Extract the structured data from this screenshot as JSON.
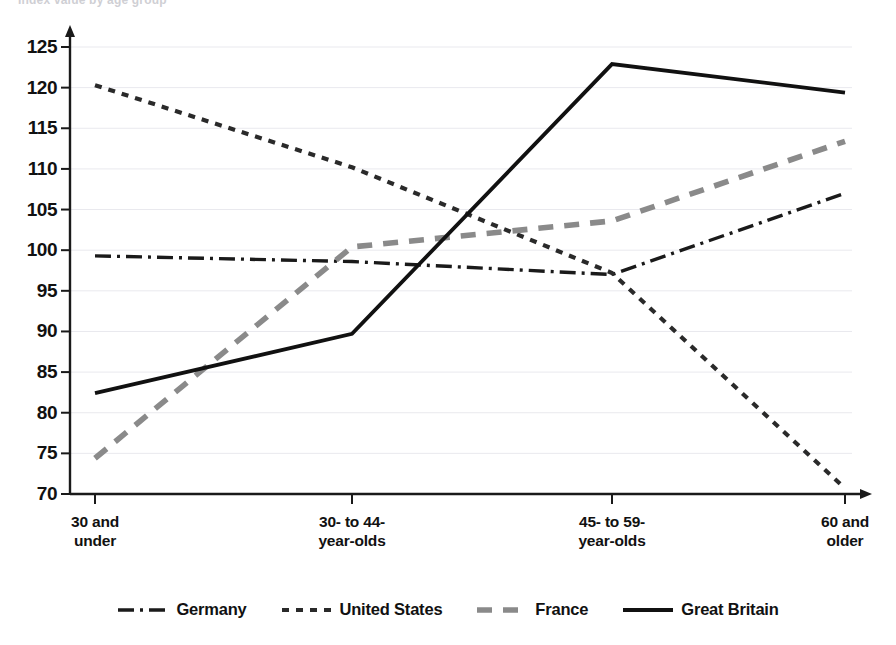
{
  "figure": {
    "clipped_header_text": "Index value by age group",
    "axis_color": "#1a1a1a",
    "grid_color": "#e9e9ee",
    "background": "#ffffff"
  },
  "chart_data": {
    "type": "line",
    "title": "",
    "subtitle": "",
    "xlabel": "",
    "ylabel": "",
    "grid": true,
    "legend_position": "bottom",
    "categories": [
      "30 and\nunder",
      "30- to 44-\nyear-olds",
      "45- to 59-\nyear-olds",
      "60 and\nolder"
    ],
    "category_labels_flat": [
      "30 and under",
      "30- to 44-year-olds",
      "45- to 59-year-olds",
      "60 and older"
    ],
    "ylim": [
      70,
      125
    ],
    "yticks": [
      125,
      120,
      115,
      110,
      105,
      100,
      95,
      90,
      85,
      80,
      75,
      70
    ],
    "ytick_labels": [
      "125",
      "120",
      "115",
      "110",
      "105",
      "100",
      "95",
      "90",
      "85",
      "80",
      "75",
      "70"
    ],
    "series": [
      {
        "name": "Germany",
        "values": [
          99.3,
          98.6,
          97.0,
          107.0
        ],
        "style": "dash-dot",
        "color": "#1a1a1a",
        "width": 3.4,
        "dasharray": "16,6,3,6"
      },
      {
        "name": "United States",
        "values": [
          120.3,
          110.2,
          97.2,
          70.7
        ],
        "style": "dotted",
        "color": "#2a2a2a",
        "width": 4.2,
        "dasharray": "7,7"
      },
      {
        "name": "France",
        "values": [
          74.4,
          100.4,
          103.6,
          113.4
        ],
        "style": "dashed",
        "color": "#8a8a8a",
        "width": 5.6,
        "dasharray": "15,11"
      },
      {
        "name": "Great Britain",
        "values": [
          82.4,
          89.7,
          122.9,
          119.4
        ],
        "style": "solid",
        "color": "#111111",
        "width": 3.8,
        "dasharray": "none"
      }
    ]
  },
  "legend": {
    "items": [
      {
        "label": "Germany",
        "swatch": "dash-dot-swatch"
      },
      {
        "label": "United States",
        "swatch": "dotted-swatch"
      },
      {
        "label": "France",
        "swatch": "dashed-gray-swatch"
      },
      {
        "label": "Great Britain",
        "swatch": "solid-swatch"
      }
    ]
  }
}
